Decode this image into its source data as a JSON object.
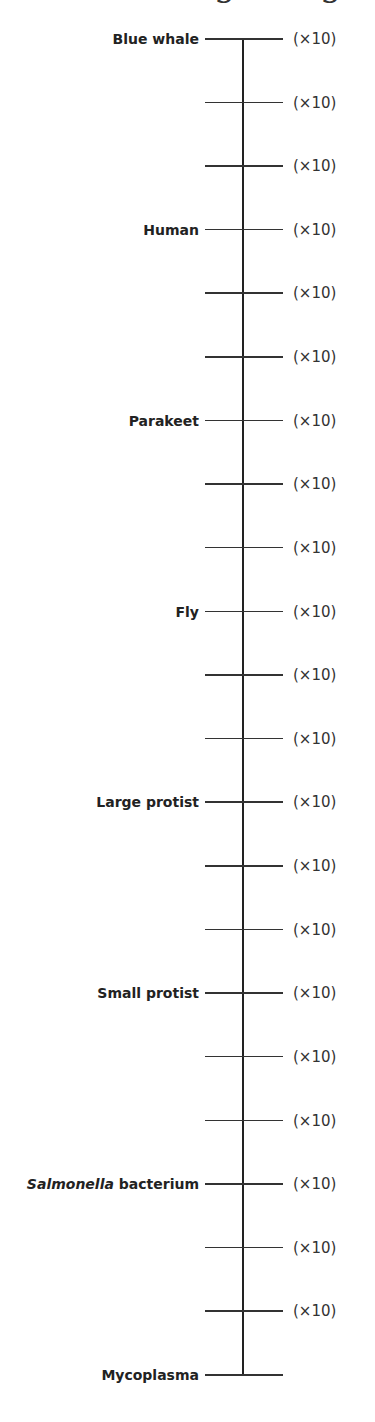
{
  "title_fragment": {
    "visible_glyphs": [
      "g",
      "g"
    ]
  },
  "scale": {
    "factor_label": "(×10)",
    "ticks": [
      {
        "label": "Blue whale",
        "factor": "(×10)"
      },
      {
        "label": "",
        "factor": "(×10)"
      },
      {
        "label": "",
        "factor": "(×10)"
      },
      {
        "label": "Human",
        "factor": "(×10)"
      },
      {
        "label": "",
        "factor": "(×10)"
      },
      {
        "label": "",
        "factor": "(×10)"
      },
      {
        "label": "Parakeet",
        "factor": "(×10)"
      },
      {
        "label": "",
        "factor": "(×10)"
      },
      {
        "label": "",
        "factor": "(×10)"
      },
      {
        "label": "Fly",
        "factor": "(×10)"
      },
      {
        "label": "",
        "factor": "(×10)"
      },
      {
        "label": "",
        "factor": "(×10)"
      },
      {
        "label": "Large protist",
        "factor": "(×10)"
      },
      {
        "label": "",
        "factor": "(×10)"
      },
      {
        "label": "",
        "factor": "(×10)"
      },
      {
        "label": "Small protist",
        "factor": "(×10)"
      },
      {
        "label": "",
        "factor": "(×10)"
      },
      {
        "label": "",
        "factor": "(×10)"
      },
      {
        "label_italic": "Salmonella",
        "label": " bacterium",
        "factor": "(×10)"
      },
      {
        "label": "",
        "factor": "(×10)"
      },
      {
        "label": "",
        "factor": "(×10)"
      },
      {
        "label": "Mycoplasma",
        "factor": ""
      }
    ]
  }
}
